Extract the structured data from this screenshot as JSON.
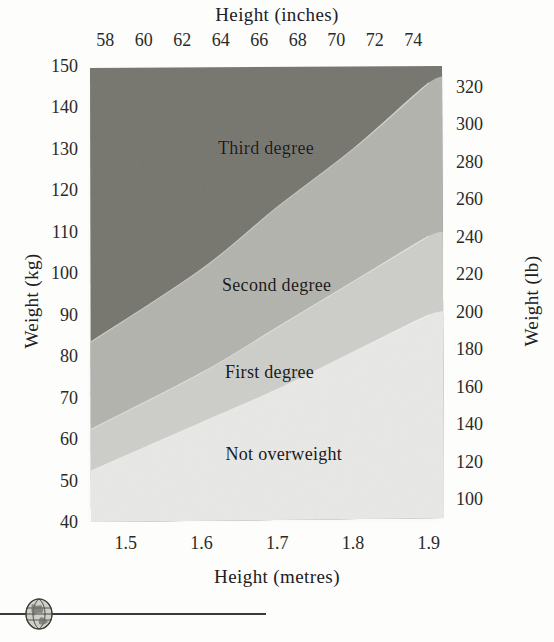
{
  "chart_data": {
    "type": "area",
    "title": "",
    "xlabel": "Height (metres)",
    "ylabel": "Weight (kg)",
    "xlabel_secondary": "Height (inches)",
    "ylabel_secondary": "Weight (lb)",
    "grid": false,
    "legend": "in-plot band labels",
    "xlim": [
      1.45,
      1.92
    ],
    "ylim": [
      40,
      150
    ],
    "xlim_secondary": [
      57.1,
      75.6
    ],
    "ylim_secondary": [
      88,
      331
    ],
    "x_ticks": [
      "1.5",
      "1.6",
      "1.7",
      "1.8",
      "1.9"
    ],
    "x_ticks_secondary": [
      "58",
      "60",
      "62",
      "64",
      "66",
      "68",
      "70",
      "72",
      "74"
    ],
    "y_ticks": [
      "40",
      "50",
      "60",
      "70",
      "80",
      "90",
      "100",
      "110",
      "120",
      "130",
      "140",
      "150"
    ],
    "y_ticks_secondary": [
      "100",
      "120",
      "140",
      "160",
      "180",
      "200",
      "220",
      "240",
      "260",
      "280",
      "300",
      "320"
    ],
    "bands": [
      {
        "name": "Not overweight",
        "label": "Not overweight",
        "color": "#e8e8e6",
        "description": "lowest band, below the first-degree boundary",
        "boundary_upper_kg_at_height": [
          {
            "height_m": 1.45,
            "weight_kg": 52
          },
          {
            "height_m": 1.6,
            "weight_kg": 64
          },
          {
            "height_m": 1.7,
            "weight_kg": 72
          },
          {
            "height_m": 1.8,
            "weight_kg": 81
          },
          {
            "height_m": 1.9,
            "weight_kg": 90
          }
        ]
      },
      {
        "name": "First degree",
        "label": "First degree",
        "color": "#cdcdc9",
        "description": "first band above not-overweight",
        "boundary_upper_kg_at_height": [
          {
            "height_m": 1.45,
            "weight_kg": 62
          },
          {
            "height_m": 1.6,
            "weight_kg": 76
          },
          {
            "height_m": 1.7,
            "weight_kg": 87
          },
          {
            "height_m": 1.8,
            "weight_kg": 98
          },
          {
            "height_m": 1.9,
            "weight_kg": 109
          }
        ]
      },
      {
        "name": "Second degree",
        "label": "Second degree",
        "color": "#b3b3ae",
        "description": "second band, between first and third degree",
        "boundary_upper_kg_at_height": [
          {
            "height_m": 1.45,
            "weight_kg": 83
          },
          {
            "height_m": 1.6,
            "weight_kg": 101
          },
          {
            "height_m": 1.7,
            "weight_kg": 116
          },
          {
            "height_m": 1.8,
            "weight_kg": 130
          },
          {
            "height_m": 1.9,
            "weight_kg": 146
          }
        ]
      },
      {
        "name": "Third degree",
        "label": "Third degree",
        "color": "#76766f",
        "description": "uppermost, darkest band",
        "boundary_upper_kg_at_height": [
          {
            "height_m": 1.45,
            "weight_kg": 150
          },
          {
            "height_m": 1.9,
            "weight_kg": 150
          }
        ]
      }
    ]
  },
  "axes": {
    "top": {
      "title": "Height (inches)",
      "ticks": [
        "58",
        "60",
        "62",
        "64",
        "66",
        "68",
        "70",
        "72",
        "74"
      ]
    },
    "bottom": {
      "title": "Height (metres)",
      "ticks": [
        "1.5",
        "1.6",
        "1.7",
        "1.8",
        "1.9"
      ]
    },
    "left": {
      "title": "Weight (kg)",
      "ticks": [
        "150",
        "140",
        "130",
        "120",
        "110",
        "100",
        "90",
        "80",
        "70",
        "60",
        "50",
        "40"
      ]
    },
    "right": {
      "title": "Weight (lb)",
      "ticks": [
        "320",
        "300",
        "280",
        "260",
        "240",
        "220",
        "200",
        "180",
        "160",
        "140",
        "120",
        "100"
      ]
    }
  },
  "band_labels": [
    {
      "text": "Third degree",
      "x_pct": 50,
      "y_pct": 18
    },
    {
      "text": "Second degree",
      "x_pct": 53,
      "y_pct": 48
    },
    {
      "text": "First degree",
      "x_pct": 51,
      "y_pct": 67
    },
    {
      "text": "Not overweight",
      "x_pct": 55,
      "y_pct": 85
    }
  ],
  "footer": {
    "ornament_icon": "globe-icon",
    "rule": ""
  },
  "colors": {
    "band_not_overweight": "#e8e8e6",
    "band_first_degree": "#cdcdc9",
    "band_second_degree": "#b3b3ae",
    "band_third_degree": "#76766f",
    "page_background": "#fdfdfc",
    "text": "#2b2b2b",
    "rule": "#3a3a38"
  }
}
